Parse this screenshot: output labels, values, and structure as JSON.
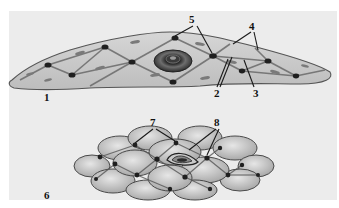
{
  "figure": {
    "top_panel": {
      "label": "1",
      "callouts": [
        {
          "id": "5",
          "text": "5"
        },
        {
          "id": "4",
          "text": "4"
        },
        {
          "id": "2",
          "text": "2"
        },
        {
          "id": "3",
          "text": "3"
        }
      ]
    },
    "bottom_panel": {
      "label": "6",
      "callouts": [
        {
          "id": "7",
          "text": "7"
        },
        {
          "id": "8",
          "text": "8"
        }
      ]
    }
  }
}
